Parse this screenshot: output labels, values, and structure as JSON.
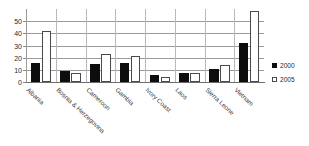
{
  "chart_data": {
    "type": "bar",
    "title": "",
    "xlabel": "",
    "ylabel": "",
    "ylim": [
      0,
      60
    ],
    "yticks": [
      0,
      10,
      20,
      30,
      40,
      50
    ],
    "ytick_labels": [
      "0",
      "10",
      "20",
      "30",
      "40",
      "50"
    ],
    "grid": true,
    "legend_position": "right",
    "categories": [
      "Albania",
      "Bosnia & Herzegovina",
      "Cameroon",
      "Gambia",
      "Ivory Coast",
      "Laos",
      "Sierra Leone",
      "Vietnam"
    ],
    "series": [
      {
        "name": "2000",
        "color": "#0d0d0d",
        "values": [
          16,
          9,
          15,
          16,
          6,
          7,
          11,
          32
        ]
      },
      {
        "name": "2005",
        "color": "#ffffff",
        "values": [
          42,
          7,
          23,
          21,
          4,
          7,
          14,
          58
        ]
      }
    ]
  },
  "legend": {
    "items": [
      {
        "label": "2000",
        "swatch": "filled-square-icon"
      },
      {
        "label": "2005",
        "swatch": "hollow-square-icon"
      }
    ]
  }
}
